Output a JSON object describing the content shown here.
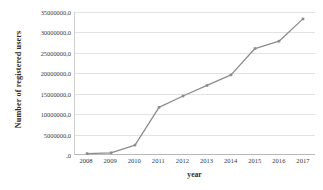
{
  "chart_data": {
    "type": "line",
    "title": "",
    "xlabel": "year",
    "ylabel": "Number of registered users",
    "categories": [
      "2008",
      "2009",
      "2010",
      "2011",
      "2012",
      "2013",
      "2014",
      "2015",
      "2016",
      "2017"
    ],
    "values": [
      100000,
      300000,
      2200000,
      11500000,
      14300000,
      16900000,
      19500000,
      26000000,
      27800000,
      33300000
    ],
    "series": [
      {
        "name": "Number of registered users",
        "values": [
          100000,
          300000,
          2200000,
          11500000,
          14300000,
          16900000,
          19500000,
          26000000,
          27800000,
          33300000
        ]
      }
    ],
    "ylim": [
      0,
      35000000
    ],
    "ytick_values": [
      0,
      5000000,
      10000000,
      15000000,
      20000000,
      25000000,
      30000000,
      35000000
    ],
    "ytick_labels": [
      ",0",
      "5000000,0",
      "10000000,0",
      "15000000,0",
      "20000000,0",
      "25000000,0",
      "30000000,0",
      "35000000,0"
    ],
    "xtick_labels": [
      "2008",
      "2009",
      "2010",
      "2011",
      "2012",
      "2013",
      "2014",
      "2015",
      "2016",
      "2017"
    ],
    "grid": true,
    "legend": false,
    "legend_position": "none",
    "line_color": "#8c8c8c",
    "marker_color": "#8c8c8c",
    "gridline_color": "#e2e2e2",
    "axis_color": "#b9b9b9",
    "background_color": "#ffffff"
  }
}
